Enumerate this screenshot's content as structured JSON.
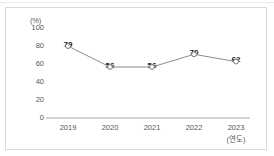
{
  "chart_data": {
    "type": "line",
    "title": "",
    "xlabel": "(연도)",
    "ylabel": "(%)",
    "categories": [
      "2019",
      "2020",
      "2021",
      "2022",
      "2023"
    ],
    "values": [
      79,
      56,
      56,
      70,
      62
    ],
    "ylim": [
      0,
      100
    ],
    "yticks": [
      "0",
      "20",
      "40",
      "60",
      "80",
      "100"
    ],
    "grid": false,
    "legend": null,
    "marker": "open-circle",
    "series": [
      {
        "name": "",
        "values": [
          79,
          56,
          56,
          70,
          62
        ]
      }
    ],
    "colors": {
      "line": "#8c8c8c",
      "marker_fill": "#ffffff",
      "marker_stroke": "#7a7a7a",
      "axis": "#a6a6a6",
      "text": "#555555",
      "value_text": "#222222",
      "frame": "#d9d9d9",
      "background": "#ffffff"
    }
  },
  "axis": {
    "unit_label": "(%)",
    "y_ticks": [
      "100",
      "80",
      "60",
      "40",
      "20",
      "0"
    ],
    "x_ticks": [
      "2019",
      "2020",
      "2021",
      "2022",
      "2023"
    ],
    "x_unit": "(연도)"
  },
  "data_labels": [
    "79",
    "56",
    "56",
    "70",
    "62"
  ]
}
